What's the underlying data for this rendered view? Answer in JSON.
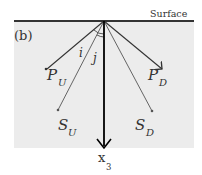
{
  "panel_label": "(b)",
  "surface_label": "Surface",
  "colors": {
    "background_box": "#ececec",
    "surface_line": "#333333",
    "ray_dark": "#333333",
    "ray_light": "#666666",
    "axis": "#000000"
  },
  "angles": {
    "i": "i",
    "j": "j"
  },
  "rays": {
    "p_up": {
      "label": "P",
      "sub": "U"
    },
    "p_down": {
      "label": "P",
      "sub": "D"
    },
    "s_up": {
      "label": "S",
      "sub": "U"
    },
    "s_down": {
      "label": "S",
      "sub": "D"
    }
  },
  "axis": {
    "label": "x",
    "sub": "3"
  }
}
